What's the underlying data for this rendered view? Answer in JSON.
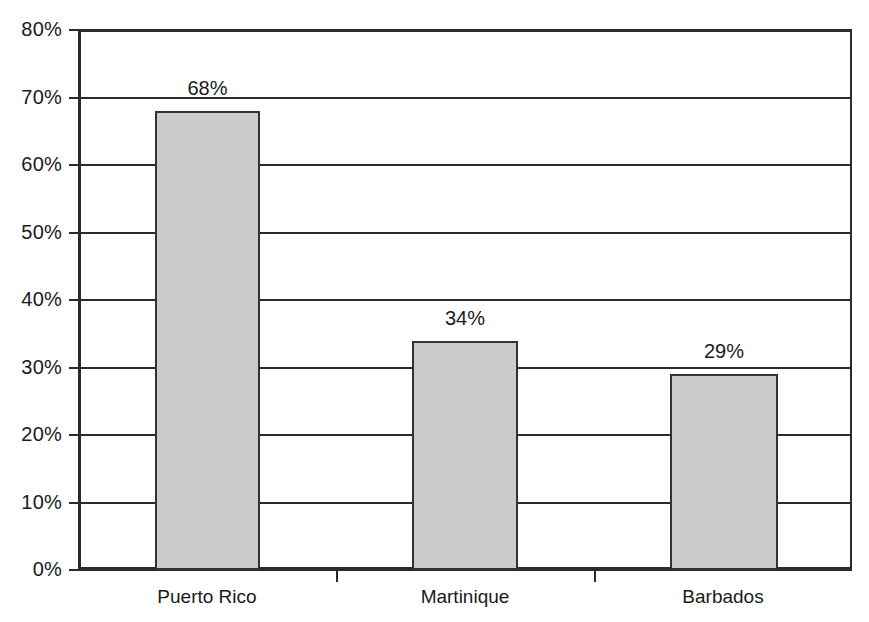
{
  "chart_data": {
    "type": "bar",
    "title": "",
    "subtitle": "",
    "xlabel": "",
    "ylabel": "",
    "categories": [
      "Puerto Rico",
      "Martinique",
      "Barbados"
    ],
    "values": [
      68,
      34,
      29
    ],
    "value_labels": [
      "68%",
      "34%",
      "29%"
    ],
    "ylim": [
      0,
      80
    ],
    "ytick_labels": [
      "0%",
      "10%",
      "20%",
      "30%",
      "40%",
      "50%",
      "60%",
      "70%",
      "80%"
    ],
    "ytick_values": [
      0,
      10,
      20,
      30,
      40,
      50,
      60,
      70,
      80
    ],
    "grid": "horizontal",
    "legend": "none",
    "series": [
      {
        "name": "",
        "values": [
          68,
          34,
          29
        ]
      }
    ],
    "colors": {
      "bar_fill": "#cbcbcb",
      "bar_border": "#333333",
      "axis": "#2b2b2b",
      "text": "#1a1a1a",
      "background": "#ffffff"
    }
  }
}
